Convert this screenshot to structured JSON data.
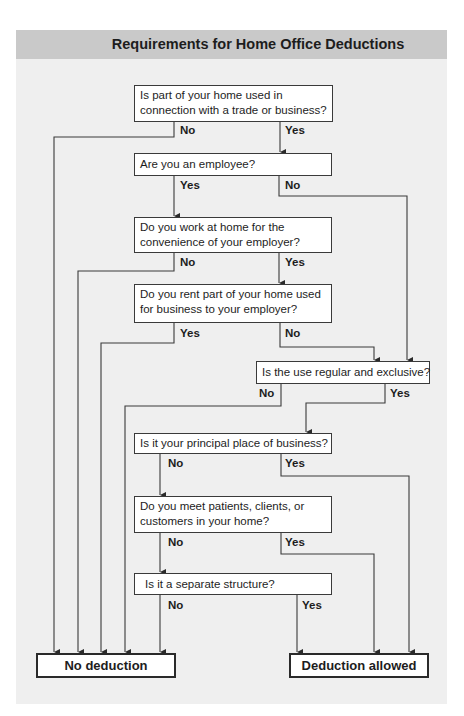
{
  "header": {
    "title": "Requirements for Home Office Deductions"
  },
  "colors": {
    "panel": "#efefef",
    "header": "#c9c9c9",
    "box": "#ffffff",
    "line": "#3a3a3a"
  },
  "nodes": {
    "q1": {
      "line1": "Is part of your home used in",
      "line2": "connection with a trade or business?"
    },
    "q2": {
      "text": "Are you an employee?"
    },
    "q3": {
      "line1": "Do you work at home for the",
      "line2": "convenience of your employer?"
    },
    "q4": {
      "line1": "Do you rent part of your home used",
      "line2": "for business to your employer?"
    },
    "q5": {
      "text": "Is the use regular and exclusive?"
    },
    "q6": {
      "text": "Is it your principal place of business?"
    },
    "q7": {
      "line1": "Do you meet patients, clients, or",
      "line2": "customers in your home?"
    },
    "q8": {
      "text": "Is it a separate structure?"
    },
    "no_deduction": {
      "text": "No deduction"
    },
    "deduction_allowed": {
      "text": "Deduction allowed"
    }
  },
  "edges": [
    {
      "from": "q1",
      "to": "no_deduction",
      "label": "No"
    },
    {
      "from": "q1",
      "to": "q2",
      "label": "Yes"
    },
    {
      "from": "q2",
      "to": "q3",
      "label": "Yes"
    },
    {
      "from": "q2",
      "to": "q5",
      "label": "No"
    },
    {
      "from": "q3",
      "to": "no_deduction",
      "label": "No"
    },
    {
      "from": "q3",
      "to": "q4",
      "label": "Yes"
    },
    {
      "from": "q4",
      "to": "no_deduction",
      "label": "Yes"
    },
    {
      "from": "q4",
      "to": "q5",
      "label": "No"
    },
    {
      "from": "q5",
      "to": "no_deduction",
      "label": "No"
    },
    {
      "from": "q5",
      "to": "q6",
      "label": "Yes"
    },
    {
      "from": "q6",
      "to": "q7",
      "label": "No"
    },
    {
      "from": "q6",
      "to": "deduction_allowed",
      "label": "Yes"
    },
    {
      "from": "q7",
      "to": "q8",
      "label": "No"
    },
    {
      "from": "q7",
      "to": "deduction_allowed",
      "label": "Yes"
    },
    {
      "from": "q8",
      "to": "no_deduction",
      "label": "No"
    },
    {
      "from": "q8",
      "to": "deduction_allowed",
      "label": "Yes"
    }
  ]
}
